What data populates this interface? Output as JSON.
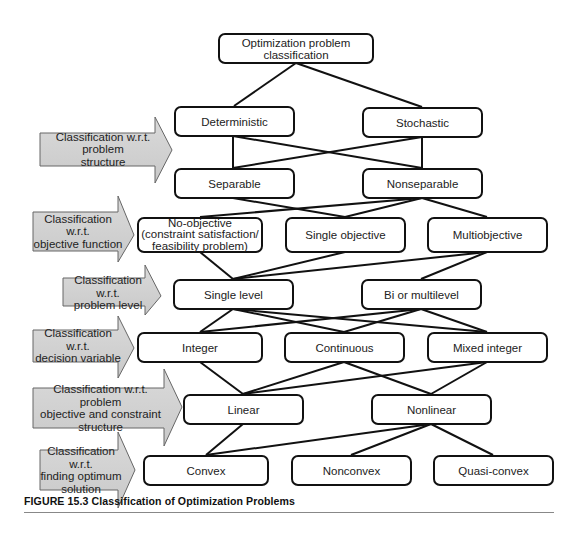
{
  "diagram": {
    "title": "Optimization problem classification",
    "levels": [
      {
        "category": "Classification w.r.t. problem structure",
        "nodes": [
          "Deterministic",
          "Stochastic"
        ]
      },
      {
        "category": "",
        "nodes": [
          "Separable",
          "Nonseparable"
        ]
      },
      {
        "category": "Classification w.r.t. objective function",
        "nodes": [
          "No-objective (constraint satisfaction/ feasibility problem)",
          "Single objective",
          "Multiobjective"
        ]
      },
      {
        "category": "Classification w.r.t. problem level",
        "nodes": [
          "Single level",
          "Bi or multilevel"
        ]
      },
      {
        "category": "Classification w.r.t. decision variable",
        "nodes": [
          "Integer",
          "Continuous",
          "Mixed integer"
        ]
      },
      {
        "category": "Classification w.r.t. problem objective and constraint structure",
        "nodes": [
          "Linear",
          "Nonlinear"
        ]
      },
      {
        "category": "Classification w.r.t. finding optimum solution",
        "nodes": [
          "Convex",
          "Nonconvex",
          "Quasi-convex"
        ]
      }
    ]
  },
  "nodes": {
    "root": "Optimization problem classification",
    "deterministic": "Deterministic",
    "stochastic": "Stochastic",
    "separable": "Separable",
    "nonseparable": "Nonseparable",
    "no_objective_line1": "No-objective",
    "no_objective_line2": "(constraint satisfaction/",
    "no_objective_line3": "feasibility problem)",
    "single_objective": "Single objective",
    "multiobjective": "Multiobjective",
    "single_level": "Single level",
    "bi_multilevel": "Bi or multilevel",
    "integer": "Integer",
    "continuous": "Continuous",
    "mixed_integer": "Mixed integer",
    "linear": "Linear",
    "nonlinear": "Nonlinear",
    "convex": "Convex",
    "nonconvex": "Nonconvex",
    "quasi_convex": "Quasi-convex"
  },
  "arrows": {
    "structure_l1": "Classification w.r.t. problem",
    "structure_l2": "structure",
    "objective_l1": "Classification w.r.t.",
    "objective_l2": "objective function",
    "level_l1": "Classification w.r.t.",
    "level_l2": "problem level",
    "decision_l1": "Classification w.r.t.",
    "decision_l2": "decision variable",
    "constraint_l1": "Classification w.r.t. problem",
    "constraint_l2": "objective and constraint",
    "constraint_l3": "structure",
    "optimum_l1": "Classification w.r.t.",
    "optimum_l2": "finding optimum",
    "optimum_l3": "solution"
  },
  "edges": [
    [
      "root",
      "deterministic"
    ],
    [
      "root",
      "stochastic"
    ],
    [
      "deterministic",
      "separable"
    ],
    [
      "deterministic",
      "nonseparable"
    ],
    [
      "stochastic",
      "separable"
    ],
    [
      "stochastic",
      "nonseparable"
    ],
    [
      "separable",
      "single_objective"
    ],
    [
      "separable",
      "multiobjective"
    ],
    [
      "nonseparable",
      "no_objective"
    ],
    [
      "nonseparable",
      "single_objective"
    ],
    [
      "nonseparable",
      "multiobjective"
    ],
    [
      "no_objective",
      "single_level"
    ],
    [
      "single_objective",
      "single_level"
    ],
    [
      "multiobjective",
      "single_level"
    ],
    [
      "multiobjective",
      "bi_multilevel"
    ],
    [
      "single_level",
      "integer"
    ],
    [
      "single_level",
      "continuous"
    ],
    [
      "single_level",
      "mixed_integer"
    ],
    [
      "bi_multilevel",
      "integer"
    ],
    [
      "bi_multilevel",
      "continuous"
    ],
    [
      "bi_multilevel",
      "mixed_integer"
    ],
    [
      "integer",
      "linear"
    ],
    [
      "continuous",
      "linear"
    ],
    [
      "continuous",
      "nonlinear"
    ],
    [
      "mixed_integer",
      "linear"
    ],
    [
      "mixed_integer",
      "nonlinear"
    ],
    [
      "linear",
      "convex"
    ],
    [
      "nonlinear",
      "convex"
    ],
    [
      "nonlinear",
      "nonconvex"
    ],
    [
      "nonlinear",
      "quasi_convex"
    ]
  ],
  "caption": "FIGURE 15.3  Classification of Optimization Problems",
  "colors": {
    "arrow_fill": "#d4d4d4",
    "arrow_stroke": "#555555",
    "box_border": "#111111",
    "line": "#111111"
  }
}
